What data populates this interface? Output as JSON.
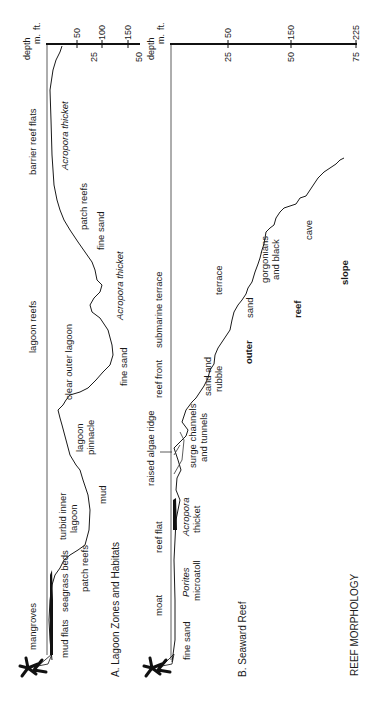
{
  "figure_title": "REEF MORPHOLOGY",
  "panel_a": {
    "title": "A. Lagoon Zones and Habitats",
    "zones": [
      "mangroves",
      "lagoon reefs",
      "barrier reef flats"
    ],
    "labels": {
      "mud_flats": "mud flats",
      "seagrass_beds": "seagrass beds",
      "patch_reefs_1": "patch reefs",
      "turbid_line1": "turbid inner",
      "turbid_line2": "lagoon",
      "mud": "mud",
      "pinnacle_line1": "lagoon",
      "pinnacle_line2": "pinnacle",
      "clear_outer_lagoon": "clear outer lagoon",
      "fine_sand_1": "fine sand",
      "acropora_thicket_1": "Acropora thicket",
      "fine_sand_2": "fine sand",
      "patch_reefs_2": "patch reefs",
      "acropora_thicket_2": "Acropora thicket"
    },
    "axis": {
      "title": "depth",
      "unit_m": "m.",
      "unit_ft": "ft.",
      "m_ticks": [
        "25",
        "50"
      ],
      "ft_ticks": [
        "50",
        "100",
        "150"
      ]
    }
  },
  "panel_b": {
    "title": "B. Seaward Reef",
    "labels": {
      "fine_sand": "fine sand",
      "moat": "moat",
      "porites": "Porites",
      "microatoll": "microatoll",
      "reef_flat": "reef flat",
      "acropora": "Acropora",
      "thicket": "thicket",
      "raised_algae_ridge": "raised algae ridge",
      "surge_line1": "surge channels",
      "surge_line2": "and tunnels",
      "reef_front": "reef front",
      "sand_rubble_line1": "sand and",
      "sand_rubble_line2": "rubble",
      "submarine_terrace": "submarine terrace",
      "terrace": "terrace",
      "sand": "sand",
      "gorg_line1": "gorgonians",
      "gorg_line2": "and black",
      "gorg_line3": "coral",
      "cave": "cave",
      "outer": "outer",
      "reef": "reef",
      "slope": "slope"
    },
    "axis": {
      "title": "depth",
      "unit_m": "m.",
      "unit_ft": "ft.",
      "m_ticks": [
        "25",
        "50",
        "75"
      ],
      "ft_ticks": [
        "50",
        "150",
        "225"
      ]
    }
  }
}
